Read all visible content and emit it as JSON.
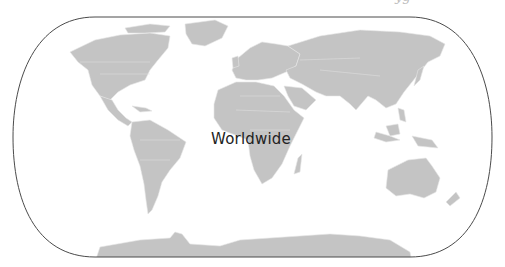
{
  "map": {
    "projection_outline": "rounded-world-frame",
    "land_color": "#c4c4c4",
    "outline_color": "#4a4a4a",
    "background": "#ffffff",
    "label": "Worldwide",
    "top_clipped_text": "yg"
  }
}
